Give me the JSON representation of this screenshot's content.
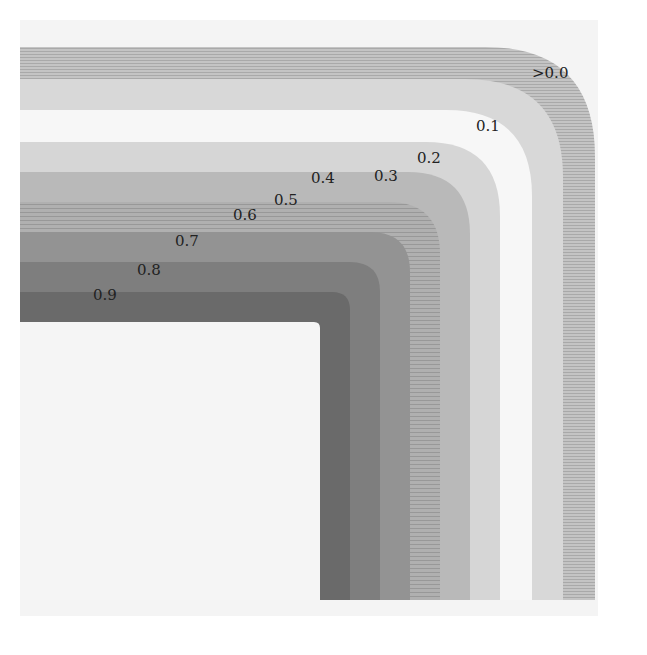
{
  "figure": {
    "background_region": {
      "x": 20,
      "y": 20,
      "width": 578,
      "height": 596,
      "color": "#f4f4f4"
    },
    "inner_region": {
      "label": "",
      "color": "#f5f5f5"
    },
    "corner": {
      "x": 320,
      "y": 322
    },
    "bottom": 600,
    "left": 20,
    "bands": [
      {
        "value": "0.1",
        "offset": 275,
        "radius": 110,
        "color": "#bdbdbd",
        "striped": true
      },
      {
        "value": "0.2",
        "offset": 243,
        "radius": 98,
        "color": "#d8d8d8",
        "striped": false
      },
      {
        "value": "0.3",
        "offset": 212,
        "radius": 86,
        "color": "#f7f7f7",
        "striped": false
      },
      {
        "value": "0.4",
        "offset": 180,
        "radius": 74,
        "color": "#d6d6d6",
        "striped": false
      },
      {
        "value": "0.5",
        "offset": 150,
        "radius": 62,
        "color": "#b9b9b9",
        "striped": false
      },
      {
        "value": "0.6",
        "offset": 120,
        "radius": 52,
        "color": "#a8a8a8",
        "striped": true
      },
      {
        "value": "0.7",
        "offset": 90,
        "radius": 40,
        "color": "#939393",
        "striped": false
      },
      {
        "value": "0.8",
        "offset": 60,
        "radius": 30,
        "color": "#7e7e7e",
        "striped": false
      },
      {
        "value": "0.9",
        "offset": 30,
        "radius": 18,
        "color": "#6a6a6a",
        "striped": false
      },
      {
        "value": "inner",
        "offset": 0,
        "radius": 6,
        "color": "#f5f5f5",
        "striped": false
      }
    ],
    "labels": [
      {
        "text": ">0.0",
        "x": 532,
        "y": 78
      },
      {
        "text": "0.1",
        "x": 476,
        "y": 131
      },
      {
        "text": "0.2",
        "x": 417,
        "y": 163
      },
      {
        "text": "0.3",
        "x": 374,
        "y": 181
      },
      {
        "text": "0.4",
        "x": 311,
        "y": 183
      },
      {
        "text": "0.5",
        "x": 274,
        "y": 205
      },
      {
        "text": "0.6",
        "x": 233,
        "y": 220
      },
      {
        "text": "0.7",
        "x": 175,
        "y": 246
      },
      {
        "text": "0.8",
        "x": 137,
        "y": 275
      },
      {
        "text": "0.9",
        "x": 93,
        "y": 300
      }
    ]
  }
}
